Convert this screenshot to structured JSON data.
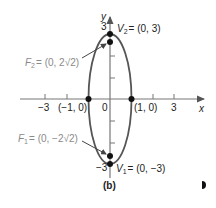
{
  "figure": {
    "caption": "(b)",
    "axes": {
      "x_label": "x",
      "y_label": "y",
      "origin_label": "0",
      "x_tick_labels": [
        "−3",
        "3"
      ],
      "y_tick_labels": [
        "3",
        "−3"
      ]
    },
    "curve": {
      "type": "ellipse",
      "equation_shape": "vertical major axis",
      "center": [
        0,
        0
      ],
      "semi_major_y": 3,
      "semi_minor_x": 1,
      "color": "#555555"
    },
    "points": {
      "v2": {
        "name": "V",
        "sub": "2",
        "coords": "= (0, 3)"
      },
      "v1": {
        "name": "V",
        "sub": "1",
        "coords": "= (0, −3)"
      },
      "f2": {
        "name": "F",
        "sub": "2",
        "coords": "= (0, 2√2)"
      },
      "f1": {
        "name": "F",
        "sub": "1",
        "coords": "= (0, −2√2)"
      },
      "left_intercept": "(−1, 0)",
      "right_intercept": "(1, 0)"
    },
    "marker_icon": "half-circle-marker"
  }
}
